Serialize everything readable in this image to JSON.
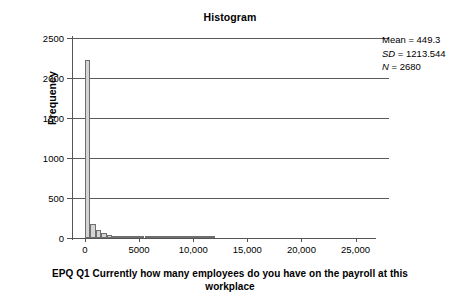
{
  "chart_data": {
    "type": "bar",
    "title": "Histogram",
    "xlabel": "EPQ Q1 Currently how many employees do you have on the payroll at this workplace",
    "ylabel": "Frequency",
    "xlim": [
      -1200,
      26800
    ],
    "ylim": [
      0,
      2500
    ],
    "grid": true,
    "bin_width": 500,
    "x_ticks": [
      0,
      5000,
      10000,
      15000,
      20000,
      25000
    ],
    "x_tick_labels": [
      "0",
      "5000",
      "10,000",
      "15,000",
      "20,000",
      "25,000"
    ],
    "y_ticks": [
      0,
      500,
      1000,
      1500,
      2000,
      2500
    ],
    "y_tick_labels": [
      "0",
      "500",
      "1000",
      "1500",
      "2000",
      "2500"
    ],
    "bins": [
      {
        "x": 250,
        "value": 2220
      },
      {
        "x": 750,
        "value": 180
      },
      {
        "x": 1250,
        "value": 98
      },
      {
        "x": 1750,
        "value": 57
      },
      {
        "x": 2250,
        "value": 36
      },
      {
        "x": 2750,
        "value": 24
      },
      {
        "x": 3250,
        "value": 20
      },
      {
        "x": 3750,
        "value": 14
      },
      {
        "x": 4250,
        "value": 12
      },
      {
        "x": 4750,
        "value": 9
      },
      {
        "x": 5250,
        "value": 5
      },
      {
        "x": 5750,
        "value": 4
      },
      {
        "x": 6250,
        "value": 4
      },
      {
        "x": 6750,
        "value": 3
      },
      {
        "x": 7250,
        "value": 3
      },
      {
        "x": 7750,
        "value": 2
      },
      {
        "x": 8250,
        "value": 2
      },
      {
        "x": 8750,
        "value": 2
      },
      {
        "x": 9250,
        "value": 2
      },
      {
        "x": 9750,
        "value": 1
      },
      {
        "x": 10250,
        "value": 1
      },
      {
        "x": 10750,
        "value": 1
      },
      {
        "x": 11250,
        "value": 1
      },
      {
        "x": 11750,
        "value": 1
      }
    ],
    "annotations": {
      "mean_label": "Mean = 449.3",
      "sd_prefix": "SD",
      "sd_value": " = 1213.544",
      "n_prefix": "N",
      "n_value": " = 2680",
      "mean": 449.3,
      "sd": 1213.544,
      "n": 2680
    }
  }
}
